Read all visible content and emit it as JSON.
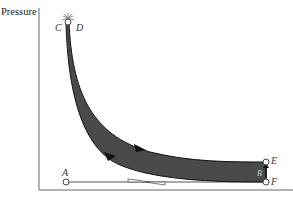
{
  "diagram": {
    "type": "pressure-volume cycle",
    "y_axis_label": "Pressure",
    "x_axis_label": "",
    "colors": {
      "axis": "#666666",
      "loop_fill": "#4a4a4a",
      "loop_stroke": "#111111",
      "line": "#555555",
      "point_fill": "#ffffff"
    },
    "points": {
      "A": "A",
      "B": "B",
      "C": "C",
      "D": "D",
      "E": "E",
      "F": "F"
    },
    "ignition_symbol": "spark at C/D"
  }
}
